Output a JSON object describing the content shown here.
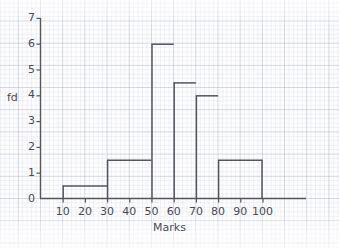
{
  "figure": {
    "kind": "histogram-on-graph-paper",
    "ylabel": "fd",
    "xlabel": "Marks"
  },
  "chart_data": {
    "type": "bar",
    "title": "",
    "subtitle": "",
    "xlabel": "Marks",
    "ylabel": "fd",
    "xlim": [
      0,
      110
    ],
    "ylim": [
      0,
      7
    ],
    "grid": true,
    "legend": false,
    "legend_position": "none",
    "x_ticks": [
      10,
      20,
      30,
      40,
      50,
      60,
      70,
      80,
      90,
      100
    ],
    "x_tick_labels": [
      "10",
      "20",
      "30",
      "40",
      "50",
      "60",
      "70",
      "80",
      "90",
      "100"
    ],
    "y_ticks": [
      0,
      1,
      2,
      3,
      4,
      5,
      6,
      7
    ],
    "y_tick_labels": [
      "0",
      "1",
      "2",
      "3",
      "4",
      "5",
      "6",
      "7"
    ],
    "bin_edges": [
      10,
      30,
      50,
      60,
      70,
      80,
      100
    ],
    "bars": [
      {
        "x_start": 10,
        "x_end": 30,
        "width": 20,
        "height": 0.5,
        "frequency": 10
      },
      {
        "x_start": 30,
        "x_end": 50,
        "width": 20,
        "height": 1.5,
        "frequency": 30
      },
      {
        "x_start": 50,
        "x_end": 60,
        "width": 10,
        "height": 6,
        "frequency": 60
      },
      {
        "x_start": 60,
        "x_end": 70,
        "width": 10,
        "height": 4.5,
        "frequency": 45
      },
      {
        "x_start": 70,
        "x_end": 80,
        "width": 10,
        "height": 4,
        "frequency": 40
      },
      {
        "x_start": 80,
        "x_end": 100,
        "width": 20,
        "height": 1.5,
        "frequency": 30
      }
    ],
    "values": [
      0.5,
      1.5,
      6,
      4.5,
      4,
      1.5
    ],
    "categories": [
      "10-30",
      "30-50",
      "50-60",
      "60-70",
      "70-80",
      "80-100"
    ]
  },
  "colors": {
    "bar_outline": "#555560",
    "axis": "#55555f",
    "grid_major": "#969fbd",
    "grid_minor": "#a5afc8",
    "text": "#4a4a52",
    "background": "#fefefe"
  }
}
